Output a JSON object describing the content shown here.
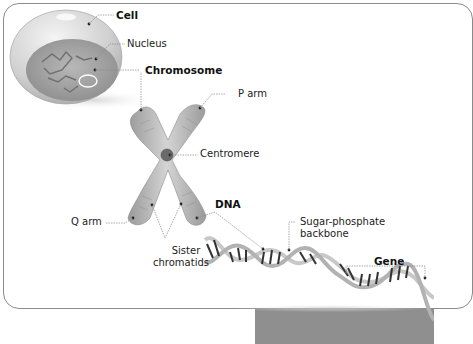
{
  "diagram": {
    "labels": {
      "cell": "Cell",
      "nucleus": "Nucleus",
      "chromosome": "Chromosome",
      "p_arm": "P arm",
      "centromere": "Centromere",
      "dna": "DNA",
      "q_arm": "Q arm",
      "sister_chromatids_line1": "Sister",
      "sister_chromatids_line2": "chromatids",
      "sugar_phosphate_line1": "Sugar-phosphate",
      "sugar_phosphate_line2": "backbone",
      "gene": "Gene"
    },
    "colors": {
      "cell_fill": "#d9d9d9",
      "nucleus_fill": "#a8a8a8",
      "chromosome_fill": "#b5b5b5",
      "dna_backbone": "#c8c8c8",
      "dna_rungs": "#333333",
      "leader_line": "#888888",
      "bottom_bar": "#8f8f8f"
    }
  }
}
